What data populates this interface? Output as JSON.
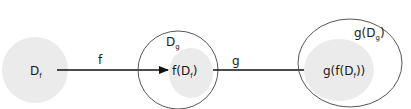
{
  "diagram": {
    "type": "function-composition",
    "colors": {
      "fill": "#ebebeb",
      "stroke": "#333333",
      "arrow": "#111111"
    },
    "nodes": {
      "df": {
        "label": "D",
        "sub": "f"
      },
      "dg": {
        "label": "D",
        "sub": "g"
      },
      "f_df": {
        "pre": "f(D",
        "sub": "f",
        "post": ")"
      },
      "g_dg": {
        "pre": "g(D",
        "sub": "g",
        "post": ")"
      },
      "g_f_df": {
        "pre": "g(f(D",
        "sub": "f",
        "post": "))"
      }
    },
    "edges": {
      "f": {
        "label": "f"
      },
      "g": {
        "label": "g"
      }
    }
  }
}
